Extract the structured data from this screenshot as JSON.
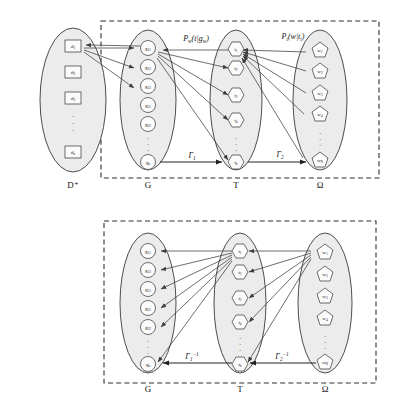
{
  "figure": {
    "background_color": "#ffffff",
    "ellipse_fill": "#ececed",
    "stroke_color": "#3a3a3a",
    "dash_box_color": "#2f2f2f"
  },
  "panels": [
    {
      "id": "top-panel",
      "name": "forward-mapping-panel",
      "sets": [
        {
          "id": "d-set",
          "label": "D⁺",
          "shape": "square",
          "outside_box": true,
          "nodes": [
            {
              "base": "d",
              "sub": "1"
            },
            {
              "base": "d",
              "sub": "2"
            },
            {
              "base": "d",
              "sub": "3"
            },
            {
              "base": "d",
              "sub": "n"
            }
          ],
          "ellipsis_after_index": 2
        },
        {
          "id": "g-set",
          "label": "G",
          "shape": "circle",
          "outside_box": false,
          "nodes": [
            {
              "base": "g",
              "sub": "11"
            },
            {
              "base": "g",
              "sub": "12"
            },
            {
              "base": "g",
              "sub": "13"
            },
            {
              "base": "g",
              "sub": "21"
            },
            {
              "base": "g",
              "sub": "22"
            },
            {
              "base": "g",
              "sub": "n"
            }
          ],
          "ellipsis_after_index": 4
        },
        {
          "id": "t-set",
          "label": "T",
          "shape": "hexagon",
          "outside_box": false,
          "nodes": [
            {
              "base": "t",
              "sub": "1"
            },
            {
              "base": "t",
              "sub": "2"
            },
            {
              "base": "t",
              "sub": "3"
            },
            {
              "base": "t",
              "sub": "4"
            },
            {
              "base": "t",
              "sub": "k"
            }
          ],
          "ellipsis_after_index": 3
        },
        {
          "id": "omega-set",
          "label": "Ω",
          "shape": "pentagon",
          "outside_box": false,
          "nodes": [
            {
              "base": "w",
              "sub": "1"
            },
            {
              "base": "w",
              "sub": "2"
            },
            {
              "base": "w",
              "sub": "3"
            },
            {
              "base": "w",
              "sub": "4"
            },
            {
              "base": "w",
              "sub": "N"
            }
          ],
          "ellipsis_after_index": 3
        }
      ],
      "edge_labels": [
        {
          "id": "p-w-label",
          "base": "P",
          "sub": "w",
          "body": "(t | g",
          "body_sub": "w",
          "tail": ")"
        },
        {
          "id": "p-t-label",
          "base": "P",
          "sub": "t",
          "body": "(w | t",
          "body_sub": "i",
          "tail": ")"
        }
      ],
      "mapping_labels": [
        {
          "id": "gamma-1",
          "base": "Γ",
          "sub": "1",
          "sup": ""
        },
        {
          "id": "gamma-2",
          "base": "Γ",
          "sub": "2",
          "sup": ""
        }
      ]
    },
    {
      "id": "bottom-panel",
      "name": "inverse-mapping-panel",
      "sets": [
        {
          "id": "g-set-2",
          "label": "G",
          "shape": "circle",
          "outside_box": false,
          "nodes": [
            {
              "base": "g",
              "sub": "11"
            },
            {
              "base": "g",
              "sub": "12"
            },
            {
              "base": "g",
              "sub": "13"
            },
            {
              "base": "g",
              "sub": "21"
            },
            {
              "base": "g",
              "sub": "22"
            },
            {
              "base": "g",
              "sub": "n"
            }
          ],
          "ellipsis_after_index": 4
        },
        {
          "id": "t-set-2",
          "label": "T",
          "shape": "hexagon",
          "outside_box": false,
          "nodes": [
            {
              "base": "t",
              "sub": "1"
            },
            {
              "base": "t",
              "sub": "2"
            },
            {
              "base": "t",
              "sub": "3"
            },
            {
              "base": "t",
              "sub": "4"
            },
            {
              "base": "t",
              "sub": "k"
            }
          ],
          "ellipsis_after_index": 3
        },
        {
          "id": "omega-set-2",
          "label": "Ω",
          "shape": "pentagon",
          "outside_box": false,
          "nodes": [
            {
              "base": "w",
              "sub": "1"
            },
            {
              "base": "w",
              "sub": "2"
            },
            {
              "base": "w",
              "sub": "3"
            },
            {
              "base": "w",
              "sub": "4"
            },
            {
              "base": "w",
              "sub": "N"
            }
          ],
          "ellipsis_after_index": 3
        }
      ],
      "mapping_labels": [
        {
          "id": "gamma-1-inv",
          "base": "Γ",
          "sub": "1",
          "sup": "−1"
        },
        {
          "id": "gamma-2-inv",
          "base": "Γ",
          "sub": "2",
          "sup": "−1"
        }
      ]
    }
  ]
}
